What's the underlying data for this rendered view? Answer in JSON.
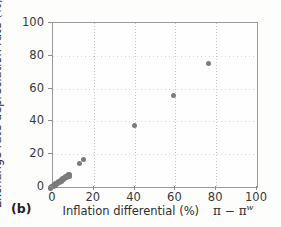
{
  "figure": {
    "panel_label": "(b)"
  },
  "chart_data": {
    "type": "scatter",
    "title": "",
    "xlabel": "Inflation differential (%)",
    "xlabel_symbol_base": "π − π",
    "xlabel_symbol_sup": "w",
    "ylabel": "Exchange rate depreciation rate (%)",
    "ylabel_symbol": "ε",
    "xlim": [
      0,
      100
    ],
    "ylim": [
      0,
      100
    ],
    "xticks": [
      0,
      20,
      40,
      60,
      80,
      100
    ],
    "yticks": [
      0,
      20,
      40,
      60,
      80,
      100
    ],
    "xticklabels": [
      "0",
      "20",
      "40",
      "60",
      "80",
      "100"
    ],
    "yticklabels": [
      "0",
      "20",
      "40",
      "60",
      "80",
      "100"
    ],
    "grid": true,
    "legend": false,
    "marker_color": "#7b7b7b",
    "axis_color": "#9a9a9a",
    "grid_color": "#c9c9c9",
    "points": [
      {
        "x": -1.2,
        "y": -0.6
      },
      {
        "x": -0.5,
        "y": 0.2
      },
      {
        "x": 0.2,
        "y": 0.4
      },
      {
        "x": 0.5,
        "y": 0.9
      },
      {
        "x": 0.8,
        "y": 1.3
      },
      {
        "x": 1.1,
        "y": 1.0
      },
      {
        "x": 1.4,
        "y": 1.8
      },
      {
        "x": 1.7,
        "y": 2.2
      },
      {
        "x": 2.0,
        "y": 1.9
      },
      {
        "x": 2.3,
        "y": 2.6
      },
      {
        "x": 2.6,
        "y": 3.1
      },
      {
        "x": 2.9,
        "y": 2.8
      },
      {
        "x": 3.2,
        "y": 3.6
      },
      {
        "x": 3.6,
        "y": 4.0
      },
      {
        "x": 3.9,
        "y": 3.4
      },
      {
        "x": 4.2,
        "y": 4.4
      },
      {
        "x": 4.5,
        "y": 4.9
      },
      {
        "x": 4.9,
        "y": 4.6
      },
      {
        "x": 5.2,
        "y": 5.4
      },
      {
        "x": 5.6,
        "y": 5.1
      },
      {
        "x": 5.9,
        "y": 6.0
      },
      {
        "x": 6.3,
        "y": 6.4
      },
      {
        "x": 6.6,
        "y": 5.9
      },
      {
        "x": 7.0,
        "y": 6.9
      },
      {
        "x": 7.4,
        "y": 7.3
      },
      {
        "x": 7.8,
        "y": 6.6
      },
      {
        "x": 8.2,
        "y": 7.6
      },
      {
        "x": 13.0,
        "y": 14.4
      },
      {
        "x": 15.1,
        "y": 17.0
      },
      {
        "x": 39.8,
        "y": 37.6
      },
      {
        "x": 58.9,
        "y": 56.0
      },
      {
        "x": 76.3,
        "y": 75.2
      }
    ]
  }
}
